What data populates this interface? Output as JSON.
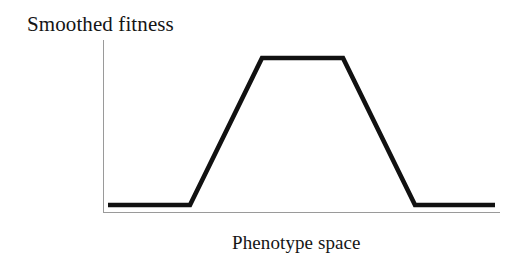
{
  "figure": {
    "background_color": "#ffffff",
    "ink_color": "#111111",
    "axis_color": "#9a9a9a"
  },
  "labels": {
    "y_axis_title": "Smoothed fitness",
    "x_axis_title": "Phenotype space"
  },
  "chart_data": {
    "type": "line",
    "title": "",
    "xlabel": "Phenotype space",
    "ylabel": "Smoothed fitness",
    "grid": false,
    "legend": "none",
    "axis_ticks": {
      "x": [],
      "y": []
    },
    "xlim": [
      0,
      1
    ],
    "ylim": [
      0,
      1
    ],
    "series": [
      {
        "name": "smoothed fitness",
        "color": "#111111",
        "line_width": 4.6,
        "shape": "trapezoid-plateau",
        "x": [
          0.0127,
          0.2246,
          0.4108,
          0.6202,
          0.8065,
          1.0
        ],
        "y": [
          0.0455,
          0.0455,
          0.8864,
          0.8864,
          0.0455,
          0.0455
        ],
        "pixel_points": [
          [
            108,
            205
          ],
          [
            190,
            205
          ],
          [
            262,
            58
          ],
          [
            343,
            58
          ],
          [
            415,
            205
          ],
          [
            495,
            205
          ]
        ],
        "annotations": [
          "low flat baseline on the left",
          "linear rise to plateau",
          "flat maximum plateau",
          "linear fall back to baseline",
          "low flat baseline on the right"
        ]
      }
    ],
    "axes_geometry": {
      "y_axis_pixel": {
        "x": 103,
        "y_top": 40,
        "y_bottom": 213
      },
      "x_axis_pixel": {
        "y": 213,
        "x_left": 103,
        "x_right": 500
      }
    }
  }
}
